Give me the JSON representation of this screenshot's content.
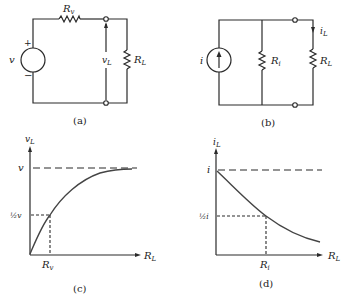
{
  "figure": {
    "panels": [
      {
        "id": "a",
        "caption": "(a)",
        "type": "circuit",
        "labels": {
          "source": "v",
          "plus": "+",
          "minus": "−",
          "series_resistor": "R",
          "series_resistor_sub": "v",
          "load_voltage": "v",
          "load_voltage_sub": "L",
          "load_resistor": "R",
          "load_resistor_sub": "L"
        }
      },
      {
        "id": "b",
        "caption": "(b)",
        "type": "circuit",
        "labels": {
          "source": "i",
          "shunt_resistor": "R",
          "shunt_resistor_sub": "i",
          "load_current": "i",
          "load_current_sub": "L",
          "load_resistor": "R",
          "load_resistor_sub": "L"
        }
      },
      {
        "id": "c",
        "caption": "(c)",
        "type": "graph",
        "labels": {
          "ylabel": "v",
          "ylabel_sub": "L",
          "xlabel": "R",
          "xlabel_sub": "L",
          "asymptote": "v",
          "half": "½v",
          "x_mark": "R",
          "x_mark_sub": "v"
        }
      },
      {
        "id": "d",
        "caption": "(d)",
        "type": "graph",
        "labels": {
          "ylabel": "i",
          "ylabel_sub": "L",
          "xlabel": "R",
          "xlabel_sub": "L",
          "asymptote": "i",
          "half": "½i",
          "x_mark": "R",
          "x_mark_sub": "i"
        }
      }
    ]
  }
}
